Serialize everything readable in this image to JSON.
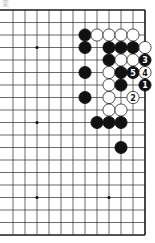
{
  "diagram": {
    "label": "変",
    "type": "go-board-partial",
    "board": {
      "origin_x": 13,
      "origin_y": 10,
      "col_spacing": 12,
      "row_spacing": 12.5,
      "cols": 12,
      "rows": 19,
      "edges": {
        "top": true,
        "right": true,
        "bottom": true,
        "left": false
      },
      "line_color": "#2a2a2a",
      "edge_color": "#1a1a1a"
    },
    "hoshi": [
      {
        "col": 2,
        "row": 3
      },
      {
        "col": 2,
        "row": 9
      },
      {
        "col": 2,
        "row": 15
      },
      {
        "col": 8,
        "row": 15
      }
    ],
    "stones": [
      {
        "color": "black",
        "col": 6,
        "row": 2
      },
      {
        "color": "white",
        "col": 7,
        "row": 2
      },
      {
        "color": "white",
        "col": 8,
        "row": 2
      },
      {
        "color": "white",
        "col": 9,
        "row": 2
      },
      {
        "color": "white",
        "col": 10,
        "row": 2
      },
      {
        "color": "black",
        "col": 6,
        "row": 3
      },
      {
        "color": "black",
        "col": 8,
        "row": 3
      },
      {
        "color": "black",
        "col": 9,
        "row": 3
      },
      {
        "color": "black",
        "col": 10,
        "row": 3
      },
      {
        "color": "white",
        "col": 11,
        "row": 3
      },
      {
        "color": "black",
        "col": 8,
        "row": 4
      },
      {
        "color": "white",
        "col": 9,
        "row": 4
      },
      {
        "color": "white",
        "col": 10,
        "row": 4
      },
      {
        "color": "black",
        "col": 11,
        "row": 4,
        "number": "3"
      },
      {
        "color": "black",
        "col": 6,
        "row": 5
      },
      {
        "color": "white",
        "col": 8,
        "row": 5
      },
      {
        "color": "black",
        "col": 9,
        "row": 5
      },
      {
        "color": "black",
        "col": 10,
        "row": 5,
        "number": "5"
      },
      {
        "color": "white",
        "col": 11,
        "row": 5,
        "number": "4"
      },
      {
        "color": "white",
        "col": 8,
        "row": 6
      },
      {
        "color": "black",
        "col": 9,
        "row": 6
      },
      {
        "color": "black",
        "col": 11,
        "row": 6,
        "number": "1"
      },
      {
        "color": "black",
        "col": 6,
        "row": 7
      },
      {
        "color": "white",
        "col": 8,
        "row": 7
      },
      {
        "color": "white",
        "col": 10,
        "row": 7,
        "number": "2"
      },
      {
        "color": "white",
        "col": 8,
        "row": 8
      },
      {
        "color": "white",
        "col": 9,
        "row": 8
      },
      {
        "color": "black",
        "col": 7,
        "row": 9
      },
      {
        "color": "black",
        "col": 8,
        "row": 9
      },
      {
        "color": "black",
        "col": 9,
        "row": 9
      },
      {
        "color": "black",
        "col": 9,
        "row": 11
      }
    ],
    "colors": {
      "black_stone": "#111111",
      "white_stone": "#ffffff",
      "white_stroke": "#222222",
      "background": "#ffffff"
    }
  }
}
